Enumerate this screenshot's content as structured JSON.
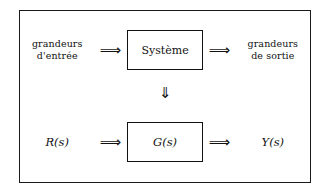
{
  "diagram": {
    "type": "block-diagram",
    "background_color": "#ffffff",
    "line_color": "#111111",
    "rows": {
      "system_row": {
        "input_label_line1": "grandeurs",
        "input_label_line2": "d'entrée",
        "input_arrow": "⟹",
        "block_label": "Système",
        "output_arrow": "⟹",
        "output_label_line1": "grandeurs",
        "output_label_line2": "de sortie"
      },
      "connector": {
        "arrow": "⇓"
      },
      "transfer_row": {
        "input_label": "R(s)",
        "input_arrow": "⟹",
        "block_label": "G(s)",
        "output_arrow": "⟹",
        "output_label": "Y(s)"
      }
    }
  }
}
